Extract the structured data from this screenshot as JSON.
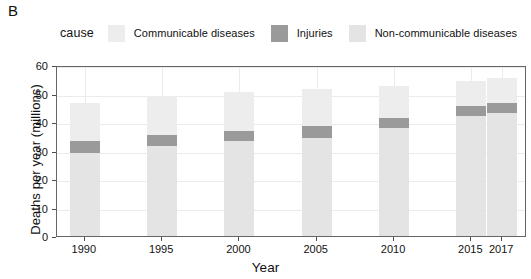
{
  "panel": {
    "label": "B"
  },
  "legend": {
    "title": "cause",
    "entries": [
      {
        "label": "Communicable diseases",
        "color": "#ededed"
      },
      {
        "label": "Injuries",
        "color": "#9a9a9a"
      },
      {
        "label": "Non-communicable diseases",
        "color": "#e4e4e4"
      }
    ]
  },
  "chart_data": {
    "type": "bar",
    "stacked": true,
    "title": "",
    "xlabel": "Year",
    "ylabel": "Deaths per year (millions)",
    "categories": [
      "1990",
      "1995",
      "2000",
      "2005",
      "2010",
      "2015",
      "2017"
    ],
    "x_tick_labels": [
      "1990",
      "1995",
      "2000",
      "2005",
      "2010",
      "2015",
      "2017"
    ],
    "y_tick_labels": [
      "0",
      "10",
      "20",
      "30",
      "40",
      "50",
      "60"
    ],
    "y_ticks": [
      0,
      10,
      20,
      30,
      40,
      50,
      60
    ],
    "ylim": [
      0,
      60
    ],
    "grid": true,
    "legend_position": "top",
    "series": [
      {
        "name": "Non-communicable diseases",
        "color": "#e4e4e4",
        "values": [
          29.0,
          31.5,
          33.5,
          34.5,
          38.0,
          42.0,
          43.0
        ]
      },
      {
        "name": "Injuries",
        "color": "#9a9a9a",
        "values": [
          4.5,
          4.0,
          3.5,
          4.0,
          3.5,
          3.5,
          3.5
        ]
      },
      {
        "name": "Communicable diseases",
        "color": "#ededed",
        "values": [
          13.0,
          13.5,
          13.5,
          13.0,
          11.0,
          9.0,
          9.0
        ]
      }
    ],
    "totals": [
      46.5,
      49.0,
      50.5,
      51.5,
      52.5,
      54.5,
      55.5
    ]
  }
}
